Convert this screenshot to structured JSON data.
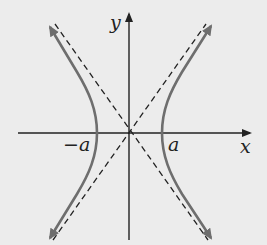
{
  "diagram": {
    "type": "hyperbola",
    "equation_form": "x^2/a^2 - y^2/b^2 = 1",
    "labels": {
      "y_axis": "y",
      "x_axis": "x",
      "vertex_left": "−a",
      "vertex_right": "a"
    },
    "colors": {
      "background": "#ececec",
      "axes": "#222222",
      "curve": "#6e6e6e",
      "asymptotes": "#222222"
    },
    "elements": [
      "x-axis with arrow",
      "y-axis with arrow",
      "right branch of hyperbola",
      "left branch of hyperbola",
      "dashed asymptote y = (b/a)x",
      "dashed asymptote y = -(b/a)x"
    ]
  }
}
